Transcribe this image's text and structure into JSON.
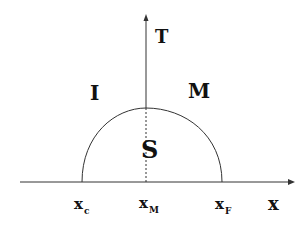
{
  "diagram": {
    "type": "phase-diagram",
    "axes": {
      "vertical_label": "T",
      "horizontal_label": "x"
    },
    "regions": [
      {
        "id": "I",
        "label": "I"
      },
      {
        "id": "M",
        "label": "M"
      },
      {
        "id": "S",
        "label": "S"
      }
    ],
    "ticks": [
      {
        "base": "x",
        "sub": "c"
      },
      {
        "base": "x",
        "sub": "M"
      },
      {
        "base": "x",
        "sub": "F"
      }
    ],
    "colors": {
      "line": "#333333",
      "text": "#111111",
      "background": "#ffffff"
    }
  }
}
